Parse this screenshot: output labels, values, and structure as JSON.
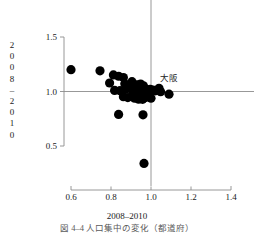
{
  "chart_data": {
    "type": "scatter",
    "title": "",
    "xlabel": "2008–2010",
    "ylabel": "2008–2010",
    "xlim": [
      0.52,
      1.48
    ],
    "ylim": [
      0.26,
      1.6
    ],
    "xticks": [
      0.6,
      0.8,
      1.0,
      1.2,
      1.4
    ],
    "xtick_labels": [
      "0.6",
      "0.8",
      "1.0",
      "1.2",
      "1.4"
    ],
    "yticks": [
      0.5,
      1.0,
      1.5
    ],
    "ytick_labels": [
      "0.5",
      "1.0",
      "1.5"
    ],
    "grid": false,
    "reference_lines": [
      {
        "orient": "vertical",
        "value": 1.0
      },
      {
        "orient": "horizontal",
        "value": 1.0
      }
    ],
    "marker": {
      "shape": "circle",
      "color": "#000000",
      "size": 4.6
    },
    "annotations": [
      {
        "text": "大阪",
        "x": 1.045,
        "y": 1.1,
        "anchor": "start"
      }
    ],
    "points": [
      {
        "x": 0.6,
        "y": 1.2
      },
      {
        "x": 0.745,
        "y": 1.19
      },
      {
        "x": 0.812,
        "y": 1.152
      },
      {
        "x": 0.838,
        "y": 1.14
      },
      {
        "x": 0.862,
        "y": 1.128
      },
      {
        "x": 0.793,
        "y": 1.078
      },
      {
        "x": 0.869,
        "y": 1.072
      },
      {
        "x": 0.905,
        "y": 1.09
      },
      {
        "x": 0.93,
        "y": 1.062
      },
      {
        "x": 0.948,
        "y": 1.068
      },
      {
        "x": 0.962,
        "y": 1.052
      },
      {
        "x": 0.818,
        "y": 1.01
      },
      {
        "x": 0.845,
        "y": 1.008
      },
      {
        "x": 0.872,
        "y": 1.022
      },
      {
        "x": 0.893,
        "y": 1.03
      },
      {
        "x": 0.908,
        "y": 1.008
      },
      {
        "x": 0.92,
        "y": 1.018
      },
      {
        "x": 0.934,
        "y": 1.012
      },
      {
        "x": 0.944,
        "y": 1.02
      },
      {
        "x": 0.952,
        "y": 1.004
      },
      {
        "x": 0.958,
        "y": 1.016
      },
      {
        "x": 0.966,
        "y": 1.026
      },
      {
        "x": 0.972,
        "y": 1.006
      },
      {
        "x": 0.978,
        "y": 1.014
      },
      {
        "x": 0.984,
        "y": 1.0
      },
      {
        "x": 0.99,
        "y": 1.01
      },
      {
        "x": 0.996,
        "y": 1.02
      },
      {
        "x": 1.002,
        "y": 1.004
      },
      {
        "x": 1.01,
        "y": 1.012
      },
      {
        "x": 1.022,
        "y": 1.006
      },
      {
        "x": 1.04,
        "y": 1.03
      },
      {
        "x": 1.048,
        "y": 0.998
      },
      {
        "x": 1.09,
        "y": 0.975
      },
      {
        "x": 0.862,
        "y": 0.952
      },
      {
        "x": 0.884,
        "y": 0.944
      },
      {
        "x": 0.906,
        "y": 0.962
      },
      {
        "x": 0.918,
        "y": 0.938
      },
      {
        "x": 0.93,
        "y": 0.955
      },
      {
        "x": 0.938,
        "y": 0.93
      },
      {
        "x": 0.946,
        "y": 0.948
      },
      {
        "x": 0.958,
        "y": 0.928
      },
      {
        "x": 0.972,
        "y": 0.944
      },
      {
        "x": 1.0,
        "y": 0.938
      },
      {
        "x": 0.838,
        "y": 0.79
      },
      {
        "x": 0.96,
        "y": 0.786
      },
      {
        "x": 0.965,
        "y": 0.34
      }
    ]
  },
  "axis": {
    "x_title": "2008–2010",
    "y_title_chars": [
      "2",
      "0",
      "0",
      "8",
      "–",
      "2",
      "0",
      "1",
      "0"
    ]
  },
  "caption": {
    "text_clipped": "図 4–4   人口集中の変化（都道府）"
  }
}
